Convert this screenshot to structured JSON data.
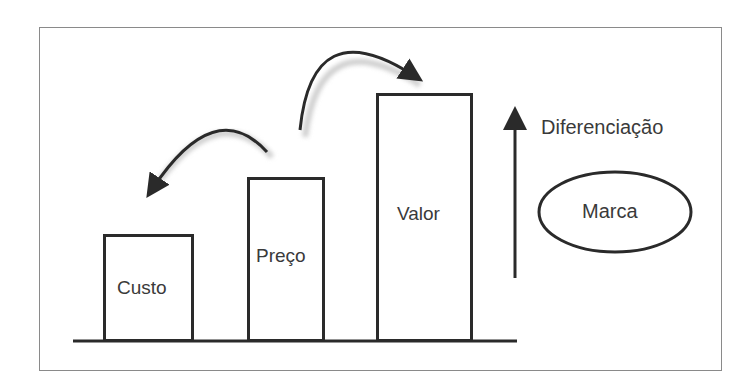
{
  "diagram": {
    "bars": [
      {
        "label": "Custo",
        "level": 1
      },
      {
        "label": "Preço",
        "level": 2
      },
      {
        "label": "Valor",
        "level": 3
      }
    ],
    "axis_label": "Diferenciação",
    "ellipse_label": "Marca",
    "arrows": [
      {
        "from": "Preço",
        "to": "Custo",
        "direction": "curved-left"
      },
      {
        "from": "Preço",
        "to": "Valor",
        "direction": "curved-right"
      }
    ],
    "colors": {
      "stroke": "#2a2a2a",
      "shadow": "#c8c8c8",
      "frame": "#8a8a8a",
      "text": "#3a3a3a"
    }
  }
}
